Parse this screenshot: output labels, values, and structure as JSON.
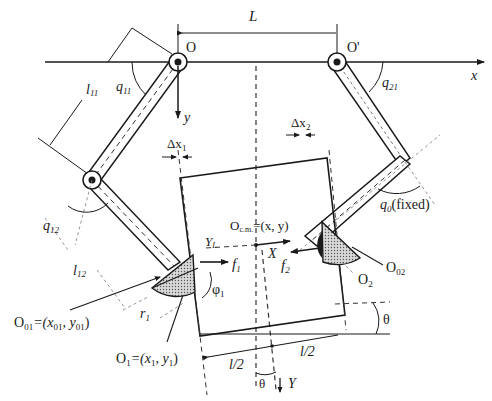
{
  "figure": {
    "type": "two-fingered robot hand grasping a rectangular object",
    "labels": {
      "L": "L",
      "O": "O",
      "O_prime": "O'",
      "x_axis": "x",
      "y_axis": "y",
      "q11": "q",
      "q11_sub": "11",
      "q12": "q",
      "q12_sub": "12",
      "q21": "q",
      "q21_sub": "21",
      "q0": "q",
      "q0_sub": "0",
      "q0_note": "(fixed)",
      "l11": "l",
      "l11_sub": "11",
      "l12": "l",
      "l12_sub": "12",
      "dx1": "Δx",
      "dx1_sub": "1",
      "dx2": "Δx",
      "dx2_sub": "2",
      "ocm": "O",
      "ocm_sub": "c.m.",
      "ocm_eq": "=(x, y)",
      "YL": "Y",
      "YL_sub": "L",
      "X_obj": "X",
      "Y_obj": "Y",
      "f1": "f",
      "f1_sub": "1",
      "f2": "f",
      "f2_sub": "2",
      "phi1": "φ",
      "phi1_sub": "1",
      "r1": "r",
      "r1_sub": "1",
      "O01": "O",
      "O01_sub": "01",
      "O01_eq": "=(x",
      "O01_eq_sub1": "01",
      "O01_eq_mid": ", y",
      "O01_eq_sub2": "01",
      "O01_eq_end": ")",
      "O02": "O",
      "O02_sub": "02",
      "O1": "O",
      "O1_sub": "1",
      "O1_eq": "=(x",
      "O1_eq_sub1": "1",
      "O1_eq_mid": ", y",
      "O1_eq_sub2": "1",
      "O1_eq_end": ")",
      "O2": "O",
      "O2_sub": "2",
      "half_l_left": "l/2",
      "half_l_right": "l/2",
      "theta_right": "θ",
      "theta_bottom": "θ"
    }
  }
}
